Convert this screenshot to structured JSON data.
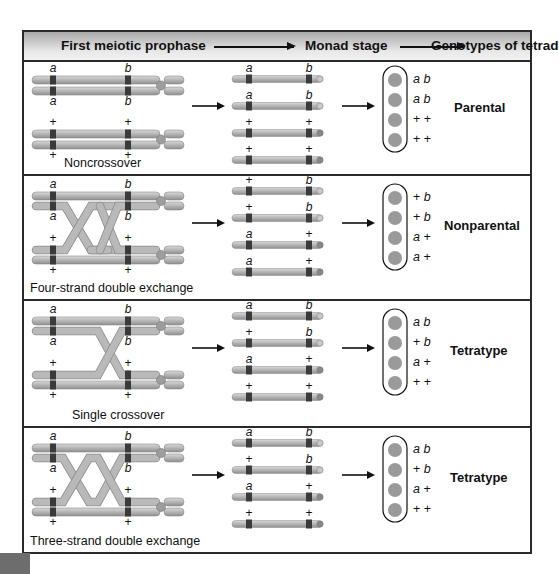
{
  "header": {
    "col1": "First meiotic prophase",
    "col2": "Monad stage",
    "col3": "Genotypes of tetrad"
  },
  "rows": [
    {
      "caption": "Noncrossover",
      "tetrad_type": "Parental",
      "prophase_labels_top": [
        "a",
        "b",
        "a",
        "b"
      ],
      "prophase_labels_bottom": [
        "+",
        "+",
        "+",
        "+"
      ],
      "monads": [
        [
          "a",
          "b"
        ],
        [
          "a",
          "b"
        ],
        [
          "+",
          "+"
        ],
        [
          "+",
          "+"
        ]
      ],
      "genotypes": [
        "a b",
        "a b",
        "+ +",
        "+ +"
      ]
    },
    {
      "caption": "Four-strand double exchange",
      "tetrad_type": "Nonparental",
      "prophase_labels_top": [
        "a",
        "b",
        "a",
        "b"
      ],
      "prophase_labels_bottom": [
        "+",
        "+",
        "+",
        "+"
      ],
      "monads": [
        [
          "+",
          "b"
        ],
        [
          "+",
          "b"
        ],
        [
          "a",
          "+"
        ],
        [
          "a",
          "+"
        ]
      ],
      "genotypes": [
        "+ b",
        "+ b",
        "a +",
        "a +"
      ]
    },
    {
      "caption": "Single crossover",
      "tetrad_type": "Tetratype",
      "prophase_labels_top": [
        "a",
        "b",
        "a",
        "b"
      ],
      "prophase_labels_bottom": [
        "+",
        "+",
        "+",
        "+"
      ],
      "monads": [
        [
          "a",
          "b"
        ],
        [
          "+",
          "b"
        ],
        [
          "a",
          "+"
        ],
        [
          "+",
          "+"
        ]
      ],
      "genotypes": [
        "a b",
        "+ b",
        "a +",
        "+ +"
      ]
    },
    {
      "caption": "Three-strand double exchange",
      "tetrad_type": "Tetratype",
      "prophase_labels_top": [
        "a",
        "b",
        "a",
        "b"
      ],
      "prophase_labels_bottom": [
        "+",
        "+",
        "+",
        "+"
      ],
      "monads": [
        [
          "a",
          "b"
        ],
        [
          "+",
          "b"
        ],
        [
          "a",
          "+"
        ],
        [
          "+",
          "+"
        ]
      ],
      "genotypes": [
        "a b",
        "+ b",
        "a +",
        "+ +"
      ]
    }
  ],
  "colors": {
    "chromatid": "#b9b9b9",
    "chromatid_dark": "#8a8a8a",
    "gene_band": "#3a3a3a",
    "spore": "#9a9a9a",
    "border": "#2a2a2a",
    "header_bg": "#d4d4d4"
  }
}
